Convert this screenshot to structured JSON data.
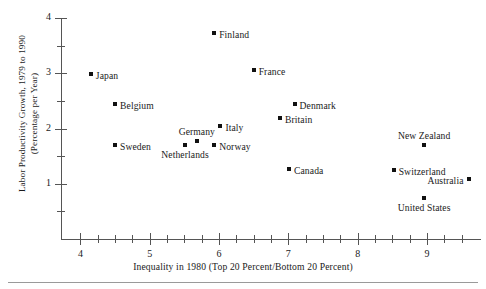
{
  "chart_data": {
    "type": "scatter",
    "title": "",
    "xlabel": "Inequality in 1980 (Top 20 Percent/Bottom 20 Percent)",
    "ylabel_line1": "Labor Productivity Growth, 1979 to 1990",
    "ylabel_line2": "(Percentage per Year)",
    "xlim": [
      3.72,
      9.78
    ],
    "ylim": [
      0,
      4
    ],
    "xticks": [
      4,
      5,
      6,
      7,
      8,
      9
    ],
    "xtick_labels": [
      "4",
      "5",
      "6",
      "7",
      "8",
      "9"
    ],
    "xminor_step": 0.25,
    "yticks": [
      1,
      2,
      3,
      4
    ],
    "ytick_labels": [
      "1",
      "2",
      "3",
      "4"
    ],
    "yminor_step": 0.5,
    "grid": false,
    "legend": "none",
    "marker_color": "#111111",
    "axis_color": "#555555",
    "points": [
      {
        "label": "Japan",
        "x": 4.15,
        "y": 2.99,
        "pos": "right"
      },
      {
        "label": "Belgium",
        "x": 4.5,
        "y": 2.44,
        "pos": "right"
      },
      {
        "label": "Sweden",
        "x": 4.5,
        "y": 1.7,
        "pos": "right"
      },
      {
        "label": "Finland",
        "x": 5.93,
        "y": 3.72,
        "pos": "right"
      },
      {
        "label": "France",
        "x": 6.5,
        "y": 3.05,
        "pos": "right"
      },
      {
        "label": "Italy",
        "x": 6.02,
        "y": 2.04,
        "pos": "right"
      },
      {
        "label": "Germany",
        "x": 5.68,
        "y": 1.77,
        "pos": "above"
      },
      {
        "label": "Netherlands",
        "x": 5.51,
        "y": 1.7,
        "pos": "below"
      },
      {
        "label": "Norway",
        "x": 5.93,
        "y": 1.7,
        "pos": "right"
      },
      {
        "label": "Denmark",
        "x": 7.09,
        "y": 2.44,
        "pos": "right"
      },
      {
        "label": "Britain",
        "x": 6.88,
        "y": 2.19,
        "pos": "right"
      },
      {
        "label": "Canada",
        "x": 7.01,
        "y": 1.27,
        "pos": "right"
      },
      {
        "label": "New Zealand",
        "x": 8.96,
        "y": 1.7,
        "pos": "above"
      },
      {
        "label": "Switzerland",
        "x": 8.52,
        "y": 1.25,
        "pos": "right"
      },
      {
        "label": "Australia",
        "x": 9.6,
        "y": 1.08,
        "pos": "left"
      },
      {
        "label": "United States",
        "x": 8.96,
        "y": 0.74,
        "pos": "below"
      }
    ]
  }
}
